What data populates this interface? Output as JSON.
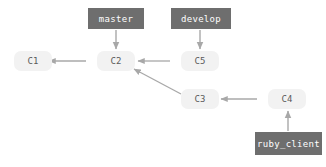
{
  "diagram": {
    "kind": "git-branch-diagram",
    "width": 326,
    "height": 167,
    "background": "#ffffff",
    "colors": {
      "ref_box_fill": "#6e6e6e",
      "ref_box_text": "#ffffff",
      "commit_fill": "#f2f2f2",
      "commit_text": "#5a5a5a",
      "edge": "#a8a8a8"
    },
    "commits": [
      {
        "id": "c1",
        "label": "C1",
        "x": 14,
        "y": 51,
        "w": 38,
        "h": 20
      },
      {
        "id": "c2",
        "label": "C2",
        "x": 97,
        "y": 51,
        "w": 38,
        "h": 20
      },
      {
        "id": "c5",
        "label": "C5",
        "x": 181,
        "y": 51,
        "w": 38,
        "h": 20
      },
      {
        "id": "c3",
        "label": "C3",
        "x": 181,
        "y": 89,
        "w": 38,
        "h": 20
      },
      {
        "id": "c4",
        "label": "C4",
        "x": 268,
        "y": 89,
        "w": 38,
        "h": 20
      }
    ],
    "refs": [
      {
        "id": "master",
        "label": "master",
        "x": 88,
        "y": 8,
        "w": 56,
        "h": 21,
        "points_to": "c2"
      },
      {
        "id": "develop",
        "label": "develop",
        "x": 171,
        "y": 8,
        "w": 60,
        "h": 21,
        "points_to": "c5"
      },
      {
        "id": "ruby_client",
        "label": "ruby_client",
        "x": 255,
        "y": 132,
        "w": 67,
        "h": 23,
        "points_to": "c4"
      }
    ],
    "edges": [
      {
        "id": "c2-to-c1",
        "from": "c2",
        "to": "c1",
        "kind": "parent-link",
        "x1": 86,
        "y1": 61,
        "x2": 49,
        "y2": 61
      },
      {
        "id": "c5-to-c2",
        "from": "c5",
        "to": "c2",
        "kind": "parent-link",
        "x1": 170,
        "y1": 61,
        "x2": 138,
        "y2": 61
      },
      {
        "id": "c3-to-c2",
        "from": "c3",
        "to": "c2",
        "kind": "parent-link",
        "x1": 181,
        "y1": 94,
        "x2": 134,
        "y2": 69
      },
      {
        "id": "c4-to-c3",
        "from": "c4",
        "to": "c3",
        "kind": "parent-link",
        "x1": 257,
        "y1": 99,
        "x2": 221,
        "y2": 99
      },
      {
        "id": "master-to-c2",
        "from": "master",
        "to": "c2",
        "kind": "ref-pointer",
        "x1": 116,
        "y1": 30,
        "x2": 116,
        "y2": 49
      },
      {
        "id": "develop-to-c5",
        "from": "develop",
        "to": "c5",
        "kind": "ref-pointer",
        "x1": 200,
        "y1": 30,
        "x2": 200,
        "y2": 49
      },
      {
        "id": "ruby_client-to-c4",
        "from": "ruby_client",
        "to": "c4",
        "kind": "ref-pointer",
        "x1": 288,
        "y1": 131,
        "x2": 288,
        "y2": 111
      }
    ]
  }
}
